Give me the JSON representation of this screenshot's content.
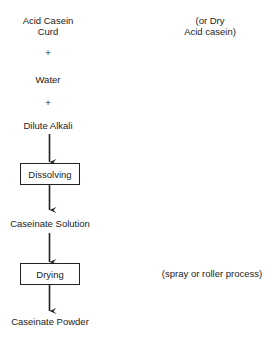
{
  "diagram": {
    "type": "process-flow",
    "inputs": {
      "acid_casein_curd": [
        "Acid Casein",
        "Curd"
      ],
      "alt_note": [
        "(or Dry",
        "Acid casein)"
      ],
      "plus_1": "+",
      "water": "Water",
      "plus_2": "+",
      "dilute_alkali": "Dilute Alkali"
    },
    "steps": {
      "dissolving": "Dissolving",
      "caseinate_solution": "Caseinate Solution",
      "drying": "Drying",
      "drying_note": "(spray or roller process)",
      "caseinate_powder": "Caseinate Powder"
    },
    "colors": {
      "line": "#222222",
      "text": "#222222",
      "background": "#ffffff"
    }
  }
}
